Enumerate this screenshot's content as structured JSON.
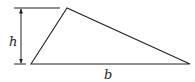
{
  "diagram": {
    "title": "",
    "type": "triangle-area",
    "labels": {
      "height": "h",
      "base": "b"
    },
    "triangle": {
      "vertices": [
        [
          31,
          64
        ],
        [
          67,
          8
        ],
        [
          190,
          64
        ]
      ]
    },
    "dimension": {
      "height_line": {
        "x": 21,
        "y1": 8,
        "y2": 64
      },
      "top_extension": {
        "x1": 14,
        "x2": 60,
        "y": 8
      },
      "bottom_extension": {
        "x1": 14,
        "x2": 26,
        "y": 64
      }
    },
    "colors": {
      "stroke": "#222222",
      "background": "#ffffff"
    }
  }
}
